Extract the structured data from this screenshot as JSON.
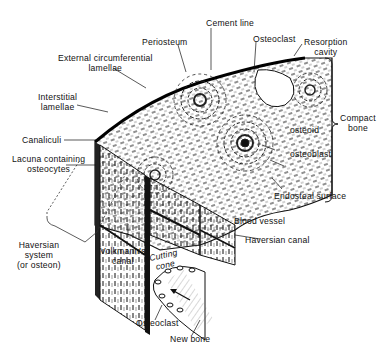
{
  "diagram": {
    "labels": {
      "cement_line": "Cement line",
      "osteoclast_top": "Osteoclast",
      "resorption_cavity_1": "Resorption",
      "resorption_cavity_2": "cavity",
      "periosteum": "Periosteum",
      "ext_circ_1": "External circumferential",
      "ext_circ_2": "lamellae",
      "interstitial_1": "Interstitial",
      "interstitial_2": "lamellae",
      "compact_bone_1": "Compact",
      "compact_bone_2": "bone",
      "canaliculi": "Canaliculi",
      "lacuna_1": "Lacuna containing",
      "lacuna_2": "osteocytes",
      "osteoid": "osteoid",
      "osteoblast": "osteoblast",
      "endosteal_surface": "Endosteal surface",
      "blood_vessel": "Blood vessel",
      "haversian_canal": "Haversian canal",
      "haversian_system_1": "Haversian",
      "haversian_system_2": "system",
      "haversian_system_3": "(or osteon)",
      "volkmanns_canal_1": "Volkmann's",
      "volkmanns_canal_2": "canal",
      "cutting_cone_1": "Cutting",
      "cutting_cone_2": "cone",
      "osteoclast_bottom": "Osteoclast",
      "new_bone": "New bone"
    },
    "colors": {
      "ink": "#111111",
      "background": "#ffffff",
      "hatch": "#555555"
    }
  }
}
